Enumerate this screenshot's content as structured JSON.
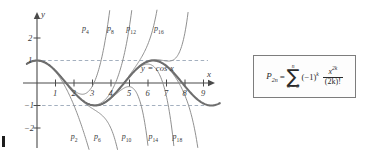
{
  "figure": {
    "kind": "taylor-polynomial-approximation-plot",
    "axes": {
      "x_axis_label": "x",
      "y_axis_label": "y",
      "x_ticks": [
        "1",
        "2",
        "3",
        "4",
        "5",
        "6",
        "7",
        "8",
        "9"
      ],
      "y_ticks": [
        "2",
        "1",
        "-1",
        "-2"
      ],
      "x_range": [
        -0.55,
        9.9
      ],
      "y_range": [
        -2.6,
        2.8
      ],
      "grid": false,
      "dashed_reference_lines": [
        1,
        -1
      ]
    },
    "curve_label": "y = cos x",
    "polynomial_labels_top": [
      {
        "base": "p",
        "sub": "4"
      },
      {
        "base": "p",
        "sub": "8"
      },
      {
        "base": "p",
        "sub": "12"
      },
      {
        "base": "p",
        "sub": "16"
      }
    ],
    "polynomial_labels_bottom": [
      {
        "base": "p",
        "sub": "2"
      },
      {
        "base": "p",
        "sub": "6"
      },
      {
        "base": "p",
        "sub": "10"
      },
      {
        "base": "p",
        "sub": "14"
      },
      {
        "base": "p",
        "sub": "18"
      }
    ],
    "colors": {
      "axis": "#4a4a4a",
      "cosine_curve": "#6e6e6e",
      "polynomial_curve": "#8a8a8a",
      "dashed_reference": "#9aa7b8",
      "formula_border": "#7d7d7d"
    }
  },
  "chart_data": {
    "type": "line",
    "title": "",
    "xlabel": "x",
    "ylabel": "y",
    "xlim": [
      -0.55,
      9.9
    ],
    "ylim": [
      -2.6,
      2.8
    ],
    "xticks": [
      1,
      2,
      3,
      4,
      5,
      6,
      7,
      8,
      9
    ],
    "yticks": [
      2,
      1,
      -1,
      -2
    ],
    "grid": false,
    "legend_position": "inline-annotations",
    "annotations": [
      {
        "text": "y = cos x",
        "x": 6.6,
        "y": 0.62
      },
      {
        "text": "p4",
        "x": 2.7,
        "y": 2.35
      },
      {
        "text": "p8",
        "x": 4.05,
        "y": 2.35
      },
      {
        "text": "p12",
        "x": 5.1,
        "y": 2.35
      },
      {
        "text": "p16",
        "x": 6.6,
        "y": 2.35
      },
      {
        "text": "p2",
        "x": 2.1,
        "y": -2.45
      },
      {
        "text": "p6",
        "x": 3.35,
        "y": -2.45
      },
      {
        "text": "p10",
        "x": 4.85,
        "y": -2.45
      },
      {
        "text": "p14",
        "x": 6.3,
        "y": -2.45
      },
      {
        "text": "p18",
        "x": 7.6,
        "y": -2.45
      }
    ],
    "series": [
      {
        "name": "y = cos x",
        "degree": null,
        "emphasis": "thick"
      },
      {
        "name": "p2",
        "degree": 2,
        "emphasis": "thin"
      },
      {
        "name": "p4",
        "degree": 4,
        "emphasis": "thin"
      },
      {
        "name": "p6",
        "degree": 6,
        "emphasis": "thin"
      },
      {
        "name": "p8",
        "degree": 8,
        "emphasis": "thin"
      },
      {
        "name": "p10",
        "degree": 10,
        "emphasis": "thin"
      },
      {
        "name": "p12",
        "degree": 12,
        "emphasis": "thin"
      },
      {
        "name": "p14",
        "degree": 14,
        "emphasis": "thin"
      },
      {
        "name": "p16",
        "degree": 16,
        "emphasis": "thin"
      },
      {
        "name": "p18",
        "degree": 18,
        "emphasis": "thin"
      }
    ]
  },
  "formula": {
    "lhs_base": "P",
    "lhs_sub": "2n",
    "equals": "=",
    "sigma": "∑",
    "sigma_top": "n",
    "sigma_bottom": "k = 0",
    "sign_term": "(−1)",
    "sign_exp": "k",
    "numerator": "x",
    "numerator_exp": "2k",
    "denominator": "(2k)!"
  }
}
